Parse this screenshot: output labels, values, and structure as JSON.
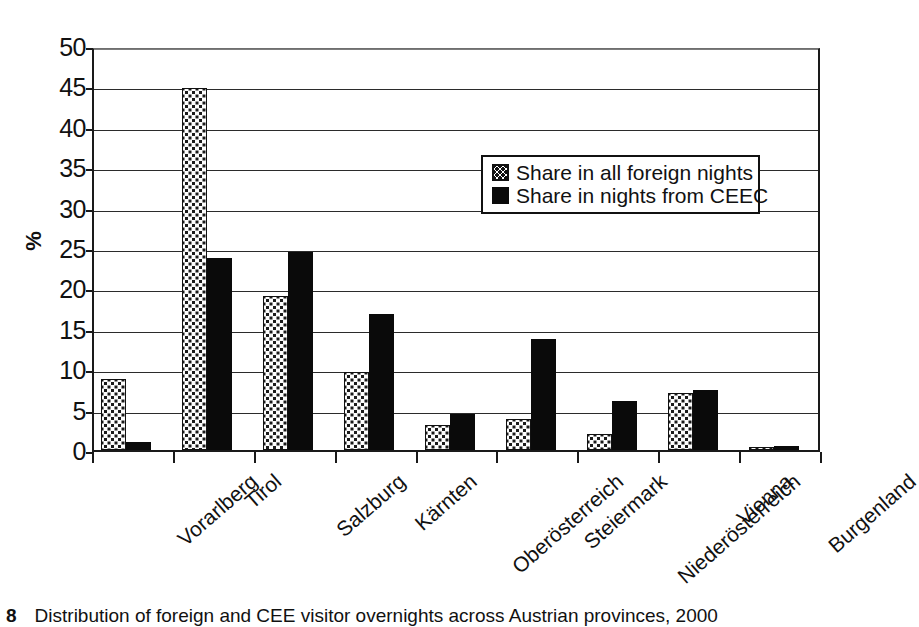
{
  "chart_data": {
    "type": "bar",
    "title": "",
    "xlabel": "",
    "ylabel": "%",
    "ylim": [
      0,
      50
    ],
    "yticks": [
      0,
      5,
      10,
      15,
      20,
      25,
      30,
      35,
      40,
      45,
      50
    ],
    "ytick_labels": [
      "0",
      "5",
      "10",
      "15",
      "20",
      "25",
      "30",
      "35",
      "40",
      "45",
      "50"
    ],
    "grid": true,
    "legend_position": "upper-right-inside",
    "categories": [
      "Vorarlberg",
      "Tirol",
      "Salzburg",
      "Kärnten",
      "Oberösterreich",
      "Steiermark",
      "Niederösterreich",
      "Vienna",
      "Burgenland"
    ],
    "series": [
      {
        "name": "Share in all foreign nights",
        "fill": "dotted-pattern",
        "color": "#ffffff",
        "values": [
          8.8,
          44.8,
          19.0,
          9.6,
          3.1,
          3.8,
          2.0,
          7.1,
          0.4
        ]
      },
      {
        "name": "Share in nights from CEEC",
        "fill": "solid",
        "color": "#0a0a0a",
        "values": [
          1.0,
          23.8,
          24.5,
          16.8,
          4.4,
          13.7,
          6.1,
          7.4,
          0.5
        ]
      }
    ]
  },
  "caption": {
    "number": "8",
    "text": "Distribution of foreign and CEE visitor overnights across Austrian provinces, 2000"
  }
}
